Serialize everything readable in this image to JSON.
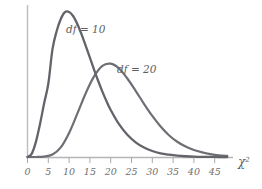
{
  "chart_data": {
    "type": "line",
    "title": "",
    "xlabel": "χ²",
    "ylabel": "",
    "xlim": [
      0,
      49
    ],
    "ylim": [
      0,
      0.1
    ],
    "grid": false,
    "legend": "inline-annotations",
    "xticks": [
      0,
      5,
      10,
      15,
      20,
      25,
      30,
      35,
      40,
      45
    ],
    "xticklabels": [
      "0",
      "5",
      "10",
      "15",
      "20",
      "25",
      "30",
      "35",
      "40",
      "45"
    ],
    "series": [
      {
        "name": "df = 10",
        "label": "df = 10",
        "color": "#63646a",
        "df": 10,
        "mode": 8,
        "peak_y": 0.0977,
        "x": [
          0,
          1,
          2,
          3,
          4,
          5,
          6,
          7,
          8,
          9,
          10,
          11,
          12,
          13,
          14,
          15,
          16,
          17,
          18,
          19,
          20,
          22,
          24,
          26,
          28,
          30,
          32,
          34,
          36,
          38,
          40,
          42,
          44,
          46,
          48
        ],
        "values": [
          0.0,
          0.0016,
          0.0077,
          0.017,
          0.0279,
          0.038,
          0.0558,
          0.0652,
          0.0716,
          0.0751,
          0.0752,
          0.073,
          0.0689,
          0.0636,
          0.0576,
          0.0515,
          0.0453,
          0.0394,
          0.0339,
          0.0289,
          0.0244,
          0.017,
          0.0115,
          0.0076,
          0.0049,
          0.0031,
          0.0019,
          0.0012,
          0.0007,
          0.0004,
          0.0002,
          0.0001,
          0.0001,
          0.0,
          0.0
        ]
      },
      {
        "name": "df = 20",
        "label": "df = 20",
        "color": "#6e6f75",
        "df": 20,
        "mode": 18,
        "peak_y": 0.0625,
        "x": [
          0,
          2,
          4,
          6,
          8,
          10,
          12,
          14,
          16,
          18,
          20,
          22,
          24,
          26,
          28,
          30,
          32,
          34,
          36,
          38,
          40,
          42,
          44,
          46,
          48
        ],
        "values": [
          0.0,
          0.0,
          0.0002,
          0.0013,
          0.005,
          0.0125,
          0.0226,
          0.0331,
          0.0418,
          0.0473,
          0.0484,
          0.0459,
          0.0407,
          0.0343,
          0.0276,
          0.0213,
          0.0158,
          0.0113,
          0.0079,
          0.0054,
          0.0036,
          0.0024,
          0.0015,
          0.0009,
          0.0006
        ]
      }
    ],
    "annotations": [
      {
        "text": "df = 10",
        "x": 11.5,
        "y": 0.082,
        "name": "df-10-label"
      },
      {
        "text": "df = 20",
        "x": 24.5,
        "y": 0.051,
        "name": "df-20-label"
      }
    ],
    "axis_label_parts": {
      "base": "χ",
      "superscript": "2"
    }
  },
  "style": {
    "background": "#ffffff",
    "axis_color": "#b9b9b9",
    "tick_color": "#a8a8a8",
    "tick_label_color": "#6f6f6f",
    "curve_color_df10": "#63646a",
    "curve_color_df20": "#6e6f75"
  }
}
